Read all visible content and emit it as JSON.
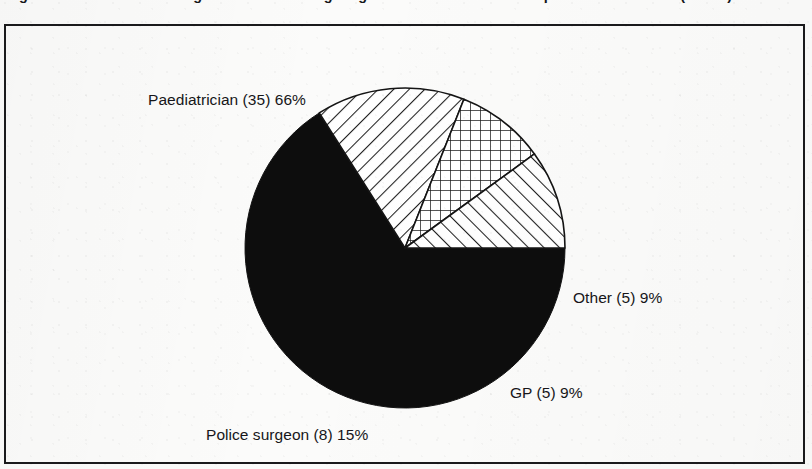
{
  "figure": {
    "caption": "Figure 1  Professional background of doctors giving evidence in cases of suspected child abuse (n = 53)"
  },
  "chart_data": {
    "type": "pie",
    "title": "",
    "total": 53,
    "start_angle_deg": 0,
    "direction": "clockwise",
    "legend": "none-labels-attached",
    "categories": [
      "Paediatrician",
      "Police surgeon",
      "GP",
      "Other"
    ],
    "values": [
      35,
      8,
      5,
      5
    ],
    "percentages": [
      66,
      15,
      9,
      9
    ],
    "labels": [
      "Paediatrician (35) 66%",
      "Police surgeon (8) 15%",
      "GP (5) 9%",
      "Other (5) 9%"
    ],
    "slices": [
      {
        "name": "Paediatrician",
        "count": 35,
        "percent": 66,
        "label": "Paediatrician (35) 66%",
        "fill": "solid-black",
        "color": "#0d0d0d",
        "start_deg": 0,
        "sweep_deg": 237.6
      },
      {
        "name": "Police surgeon",
        "count": 8,
        "percent": 15,
        "label": "Police surgeon (8) 15%",
        "fill": "diagonal-hatch-backslash",
        "color": "#1a1a1a",
        "start_deg": 237.6,
        "sweep_deg": 54.0
      },
      {
        "name": "GP",
        "count": 5,
        "percent": 9,
        "label": "GP (5) 9%",
        "fill": "cross-hatch-grid",
        "color": "#1a1a1a",
        "start_deg": 291.6,
        "sweep_deg": 32.4
      },
      {
        "name": "Other",
        "count": 5,
        "percent": 9,
        "label": "Other (5) 9%",
        "fill": "diagonal-hatch-forwardslash",
        "color": "#1a1a1a",
        "start_deg": 324.0,
        "sweep_deg": 36.0
      }
    ],
    "xlabel": "",
    "ylabel": ""
  },
  "colors": {
    "frame": "#1a1a1c",
    "text": "#161619",
    "background": "#fbfbfa",
    "ink": "#111111"
  }
}
